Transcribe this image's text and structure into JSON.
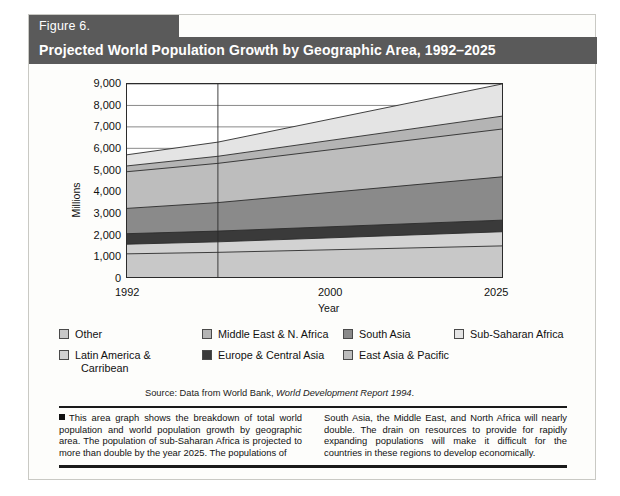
{
  "figure": {
    "tag": "Figure 6.",
    "title": "Projected World Population Growth by Geographic Area, 1992–2025"
  },
  "source": {
    "prefix": "Source: Data from World Bank, ",
    "italic": "World Development Report 1994",
    "suffix": "."
  },
  "body": {
    "left": "This area graph shows the breakdown of total world population and world population growth by geographic area. The population of sub-Saharan Africa is projected to more than double by the year 2025. The populations of",
    "right": "South Asia, the Middle East, and North Africa will nearly double. The drain on resources to provide for rapidly expanding populations will make it difficult for the countries in these regions to develop economically."
  },
  "legend": {
    "entries": [
      {
        "label": "Other",
        "color": "#c8c8c8"
      },
      {
        "label": "Middle East & N. Africa",
        "color": "#b4b4b4"
      },
      {
        "label": "South Asia",
        "color": "#8a8a8a"
      },
      {
        "label": "Sub-Saharan Africa",
        "color": "#e4e4e4"
      },
      {
        "label": "Latin America &",
        "label2": "Carribean",
        "color": "#d2d2d2"
      },
      {
        "label": "Europe & Central Asia",
        "color": "#3a3a3a"
      },
      {
        "label": "East Asia & Pacific",
        "color": "#bdbdbd"
      }
    ]
  },
  "chart_data": {
    "type": "area",
    "stacked": true,
    "title": "Projected World Population Growth by Geographic Area, 1992–2025",
    "xlabel": "Year",
    "ylabel": "Millions",
    "x": [
      1992,
      2000,
      2025
    ],
    "xticklabels": [
      "1992",
      "2000",
      "2025"
    ],
    "yticklabels": [
      "0",
      "1,000",
      "2,000",
      "3,000",
      "4,000",
      "5,000",
      "6,000",
      "7,000",
      "8,000",
      "9,000"
    ],
    "ylim": [
      0,
      9000
    ],
    "ytick_step": 1000,
    "grid": "horizontal",
    "legend_position": "below",
    "series": [
      {
        "name": "Other",
        "color": "#c8c8c8",
        "values": [
          1080,
          1150,
          1450
        ]
      },
      {
        "name": "Latin America & Carribean",
        "color": "#d2d2d2",
        "values": [
          450,
          490,
          660
        ]
      },
      {
        "name": "Europe & Central Asia",
        "color": "#3a3a3a",
        "values": [
          490,
          500,
          540
        ]
      },
      {
        "name": "South Asia",
        "color": "#8a8a8a",
        "values": [
          1180,
          1330,
          2020
        ]
      },
      {
        "name": "East Asia & Pacific",
        "color": "#bdbdbd",
        "values": [
          1710,
          1830,
          2230
        ]
      },
      {
        "name": "Middle East & N. Africa",
        "color": "#b4b4b4",
        "values": [
          270,
          330,
          600
        ]
      },
      {
        "name": "Sub-Saharan Africa",
        "color": "#e4e4e4",
        "values": [
          520,
          660,
          1500
        ]
      }
    ],
    "totals": [
      5700,
      6290,
      9000
    ],
    "cumulative": [
      {
        "year": 1992,
        "tops": [
          1080,
          1530,
          2020,
          3200,
          4910,
          5180,
          5700
        ]
      },
      {
        "year": 2000,
        "tops": [
          1150,
          1640,
          2140,
          3470,
          5300,
          5630,
          6290
        ]
      },
      {
        "year": 2025,
        "tops": [
          1450,
          2110,
          2650,
          4670,
          6900,
          7500,
          9000
        ]
      }
    ],
    "marker_line_year": 2000
  }
}
